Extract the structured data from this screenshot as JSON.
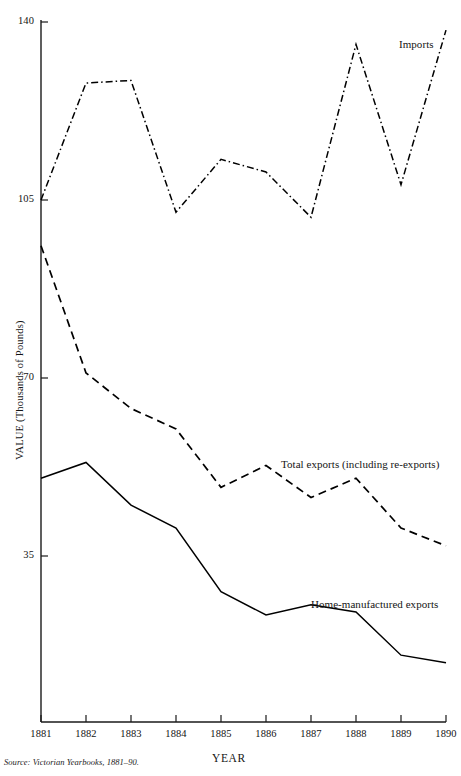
{
  "chart_data": {
    "type": "line",
    "title": "",
    "subtitle": "",
    "xlabel": "YEAR",
    "ylabel": "VALUE (Thousands of Pounds)",
    "x": [
      1881,
      1882,
      1883,
      1884,
      1885,
      1886,
      1887,
      1888,
      1889,
      1890
    ],
    "categories": [
      "1881",
      "1882",
      "1883",
      "1884",
      "1885",
      "1886",
      "1887",
      "1888",
      "1889",
      "1890"
    ],
    "xlim": [
      1881,
      1890
    ],
    "ylim": [
      0,
      140
    ],
    "yticks": [
      35,
      70,
      105,
      140
    ],
    "ytick_labels": [
      "35",
      "70",
      "105",
      "140"
    ],
    "xticks": [
      1881,
      1882,
      1883,
      1884,
      1885,
      1886,
      1887,
      1888,
      1889,
      1890
    ],
    "grid": false,
    "legend_position": "inline-annotations",
    "series": [
      {
        "name": "Imports",
        "style": "dash-dot",
        "color": "#000000",
        "values": [
          105,
          128,
          128.5,
          102.6,
          113,
          110.5,
          101.6,
          135.6,
          108,
          138.4
        ]
      },
      {
        "name": "Total exports (including re-exports)",
        "style": "dashed",
        "color": "#000000",
        "values": [
          96,
          71,
          64,
          60,
          48.5,
          52.8,
          46.5,
          50.3,
          40.5,
          37
        ]
      },
      {
        "name": "Home-manufactured exports",
        "style": "solid",
        "color": "#000000",
        "values": [
          50.3,
          53.4,
          45,
          40.5,
          28,
          23.4,
          25.4,
          24,
          15.5,
          14
        ]
      }
    ],
    "annotations": [
      {
        "text": "Imports",
        "series": "Imports"
      },
      {
        "text": "Total exports (including re-exports)",
        "series": "Total exports (including re-exports)"
      },
      {
        "text": "Home-manufactured exports",
        "series": "Home-manufactured exports"
      }
    ],
    "source": "Source: Victorian Yearbooks, 1881–90."
  },
  "axes": {
    "y_ticks": {
      "t140": "140",
      "t105": "105",
      "t70": "70",
      "t35": "35"
    },
    "y_title": "VALUE (Thousands of Pounds)",
    "x_title": "YEAR",
    "x_ticks": {
      "y1881": "1881",
      "y1882": "1882",
      "y1883": "1883",
      "y1884": "1884",
      "y1885": "1885",
      "y1886": "1886",
      "y1887": "1887",
      "y1888": "1888",
      "y1889": "1889",
      "y1890": "1890"
    }
  },
  "annotations": {
    "imports": "Imports",
    "total_exports": "Total exports (including re-exports)",
    "home_exports": "Home-manufactured exports"
  },
  "footer": {
    "source": "Source: Victorian Yearbooks, 1881–90."
  }
}
